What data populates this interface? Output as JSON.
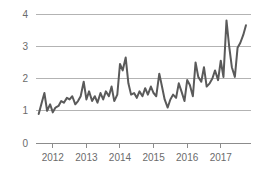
{
  "chart_data": {
    "type": "line",
    "title": "",
    "subtitle": "",
    "xlabel": "",
    "ylabel": "",
    "xlim": [
      2011.5,
      2017.9
    ],
    "ylim": [
      0,
      4.2
    ],
    "yticks": [
      "0",
      "1",
      "2",
      "3",
      "4"
    ],
    "ytick_values": [
      0,
      1,
      2,
      3,
      4
    ],
    "xticks": [
      "2012",
      "2013",
      "2014",
      "2015",
      "2016",
      "2017"
    ],
    "xtick_values": [
      2012,
      2013,
      2014,
      2015,
      2016,
      2017
    ],
    "grid": "horizontal",
    "legend": "none",
    "series": [
      {
        "name": "series-1",
        "color": "#5a5a5a",
        "x": [
          2011.58,
          2011.67,
          2011.75,
          2011.83,
          2011.92,
          2012.0,
          2012.08,
          2012.17,
          2012.25,
          2012.33,
          2012.42,
          2012.5,
          2012.58,
          2012.67,
          2012.75,
          2012.83,
          2012.92,
          2013.0,
          2013.08,
          2013.17,
          2013.25,
          2013.33,
          2013.42,
          2013.5,
          2013.58,
          2013.67,
          2013.75,
          2013.83,
          2013.92,
          2014.0,
          2014.08,
          2014.17,
          2014.25,
          2014.33,
          2014.42,
          2014.5,
          2014.58,
          2014.67,
          2014.75,
          2014.83,
          2014.92,
          2015.0,
          2015.08,
          2015.17,
          2015.25,
          2015.33,
          2015.42,
          2015.5,
          2015.58,
          2015.67,
          2015.75,
          2015.83,
          2015.92,
          2016.0,
          2016.08,
          2016.17,
          2016.25,
          2016.33,
          2016.42,
          2016.5,
          2016.58,
          2016.67,
          2016.75,
          2016.83,
          2016.92,
          2017.0,
          2017.08,
          2017.17,
          2017.25,
          2017.33,
          2017.42,
          2017.5,
          2017.58,
          2017.67,
          2017.75
        ],
        "values": [
          0.9,
          1.25,
          1.55,
          1.0,
          1.2,
          0.95,
          1.1,
          1.15,
          1.3,
          1.25,
          1.4,
          1.35,
          1.45,
          1.2,
          1.3,
          1.45,
          1.9,
          1.35,
          1.6,
          1.3,
          1.45,
          1.25,
          1.55,
          1.35,
          1.6,
          1.45,
          1.75,
          1.3,
          1.5,
          2.45,
          2.25,
          2.65,
          1.85,
          1.5,
          1.55,
          1.4,
          1.6,
          1.45,
          1.7,
          1.5,
          1.75,
          1.55,
          1.45,
          2.15,
          1.75,
          1.35,
          1.1,
          1.35,
          1.5,
          1.4,
          1.85,
          1.6,
          1.3,
          1.95,
          1.8,
          1.45,
          2.5,
          2.05,
          1.9,
          2.35,
          1.75,
          1.85,
          2.0,
          2.25,
          1.95,
          2.55,
          2.05,
          3.8,
          3.0,
          2.35,
          2.05,
          2.95,
          3.1,
          3.35,
          3.65
        ]
      }
    ]
  },
  "axes": {
    "y_tick_labels": [
      "4",
      "3",
      "2",
      "1",
      "0"
    ],
    "x_tick_labels": [
      "2012",
      "2013",
      "2014",
      "2015",
      "2016",
      "2017"
    ]
  },
  "colors": {
    "line": "#5a5a5a",
    "grid": "#b3b3b3",
    "axis": "#8c8c8c",
    "tick_text": "#6b6b6b",
    "background": "#ffffff"
  }
}
